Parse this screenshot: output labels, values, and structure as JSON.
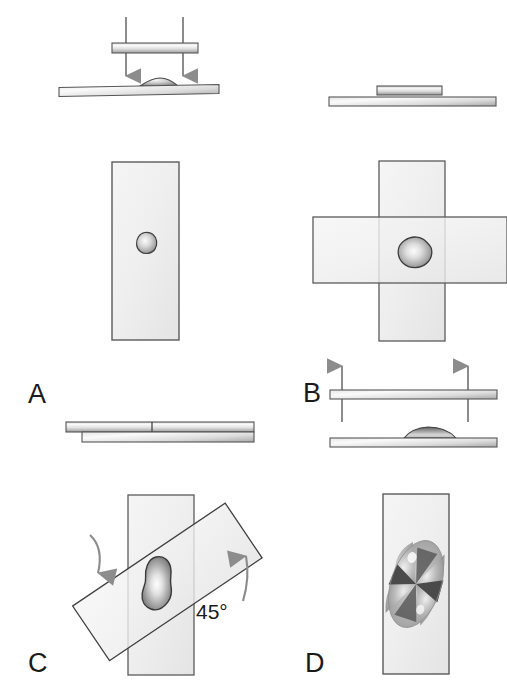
{
  "figure": {
    "background_color": "#ffffff",
    "width": 507,
    "height": 684
  },
  "colors": {
    "slide_fill": "#efefef",
    "slide_outline": "#4d4d4d",
    "slide_edge_light": "#f7f7f7",
    "slide_edge_dark": "#8a8a8a",
    "drop_outline": "#3c3c3c",
    "drop_light": "#f2f2f2",
    "drop_mid": "#9a9a9a",
    "drop_dark": "#5a5a5a",
    "arrow_color": "#8c8c8c",
    "arrow_dark": "#707070",
    "text_color": "#1a1a1a",
    "cross_dark": "#4a4a4a",
    "cross_mid": "#a8a8a8",
    "cross_light": "#e8e8e8"
  },
  "panels": [
    {
      "id": "A",
      "letter": "A",
      "caption_position": {
        "x": 28,
        "y": 381
      },
      "description": "A coverslip is pressed down onto a drop of specimen on a slide; downward arrows indicate pressing. Below, the face-on view shows a small round drop on the slide.",
      "side_view": {
        "arrows": {
          "direction": "down",
          "count": 2,
          "label": "press-down-arrows"
        },
        "upper_slide": "coverslip",
        "lower_slide": "microscope-slide",
        "drop_shape": "dome"
      },
      "face_view": {
        "slides": 1,
        "orientation": "vertical",
        "drop_shape": "small-round-blob"
      }
    },
    {
      "id": "B",
      "letter": "B",
      "caption_position": {
        "x": 303,
        "y": 394
      },
      "description": "The coverslip rests flat on the slide after pressing. Below, the face-on view shows two slides crossed at 90 degrees with a flattened drop at the intersection.",
      "side_view": {
        "arrows": {
          "direction": "none",
          "count": 0,
          "label": "no-arrows"
        },
        "upper_slide": "coverslip-resting",
        "lower_slide": "microscope-slide",
        "drop_shape": "flattened"
      },
      "face_view": {
        "slides": 2,
        "orientation": "crossed-90-degrees",
        "drop_shape": "medium-rounded-blob"
      }
    },
    {
      "id": "C",
      "letter": "C",
      "caption_position": {
        "x": 28,
        "y": 655
      },
      "description": "The two slides are slid apart and rotated. Curved arrows show rotation; the slides are offset at 45 degrees and the smear is elongated.",
      "angle_label": "45°",
      "angle_label_position": {
        "x": 196,
        "y": 607
      },
      "side_view": {
        "arrows": {
          "direction": "none",
          "count": 0,
          "label": "no-arrows"
        },
        "upper_slide": "slide-offset-left",
        "lower_slide": "slide-offset-right",
        "drop_shape": "spread-thin"
      },
      "face_view": {
        "slides": 2,
        "orientation": "rotated-45-degrees",
        "drop_shape": "elongated-smear",
        "rotation_arrows": [
          "rotate-left-arrow",
          "rotate-right-arrow"
        ]
      }
    },
    {
      "id": "D",
      "letter": "D",
      "caption_position": {
        "x": 305,
        "y": 655
      },
      "description": "Face-on view of a single slide under crossed polarizers showing the Maltese cross / butterfly birefringence extinction pattern of the smear.",
      "face_view": {
        "slides": 1,
        "orientation": "vertical",
        "drop_shape": "maltese-cross-birefringence"
      }
    }
  ],
  "labels": {
    "panel_a": "A",
    "panel_b": "B",
    "panel_c": "C",
    "panel_d": "D",
    "angle": "45°"
  }
}
